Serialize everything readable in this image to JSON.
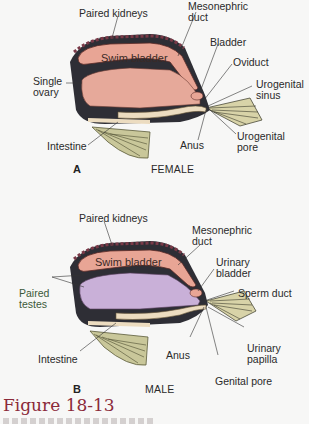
{
  "figure": {
    "title": "Figure 18-13",
    "caption_truncated": true
  },
  "panel_a": {
    "letter": "A",
    "sex": "FEMALE",
    "organ_fill": "#e6a99a",
    "labels": {
      "paired_kidneys": "Paired kidneys",
      "mesonephric_duct_1": "Mesonephric",
      "mesonephric_duct_2": "duct",
      "bladder": "Bladder",
      "oviduct": "Oviduct",
      "urogenital_sinus_1": "Urogenital",
      "urogenital_sinus_2": "sinus",
      "swim_bladder": "Swim bladder",
      "single_ovary_1": "Single",
      "single_ovary_2": "ovary",
      "intestine": "Intestine",
      "anus": "Anus",
      "urogenital_pore_1": "Urogenital",
      "urogenital_pore_2": "pore"
    }
  },
  "panel_b": {
    "letter": "B",
    "sex": "MALE",
    "organ_fill": "#c9b0d8",
    "labels": {
      "paired_kidneys": "Paired kidneys",
      "mesonephric_duct_1": "Mesonephric",
      "mesonephric_duct_2": "duct",
      "urinary_bladder_1": "Urinary",
      "urinary_bladder_2": "bladder",
      "sperm_duct": "Sperm duct",
      "swim_bladder": "Swim bladder",
      "paired_testes_1": "Paired",
      "paired_testes_2": "testes",
      "intestine": "Intestine",
      "anus": "Anus",
      "urinary_papilla_1": "Urinary",
      "urinary_papilla_2": "papilla",
      "genital_pore": "Genital pore"
    }
  },
  "colors": {
    "body_wall": "#2e2e35",
    "swim_bladder": "#e8a595",
    "intestine": "#ecdcc0",
    "fin": "#c9c79a",
    "caption": "#8b2a3a"
  }
}
